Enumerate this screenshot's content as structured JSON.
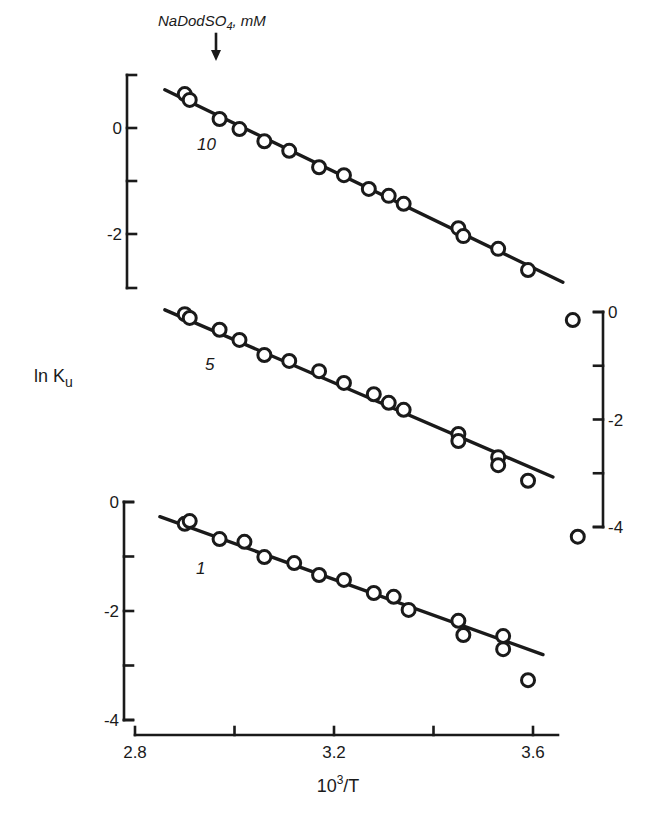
{
  "chart_data": {
    "type": "scatter",
    "title": "",
    "xlabel": "10³/T",
    "ylabel": "ln Ku",
    "annotation": "NaDodSO4, mM",
    "xlim": [
      2.8,
      3.65
    ],
    "xticks": [
      2.8,
      3.0,
      3.2,
      3.4,
      3.6
    ],
    "xtick_labels": [
      "2.8",
      "",
      "3.2",
      "",
      "3.6"
    ],
    "grid": false,
    "legend": "inline labels",
    "series": [
      {
        "name": "10",
        "label": "10",
        "axis": "left-top",
        "ylim": [
          1,
          -3
        ],
        "yticks": [
          0,
          -1,
          -2
        ],
        "ytick_labels": [
          "0",
          "",
          "-2"
        ],
        "x": [
          2.9,
          2.91,
          2.97,
          3.01,
          3.06,
          3.11,
          3.17,
          3.22,
          3.27,
          3.31,
          3.34,
          3.45,
          3.46,
          3.53,
          3.59
        ],
        "y": [
          0.64,
          0.53,
          0.17,
          -0.02,
          -0.25,
          -0.43,
          -0.74,
          -0.89,
          -1.15,
          -1.28,
          -1.43,
          -1.89,
          -2.04,
          -2.28,
          -2.68
        ],
        "fit": {
          "x": [
            2.86,
            3.66
          ],
          "y": [
            0.72,
            -2.91
          ]
        }
      },
      {
        "name": "5",
        "label": "5",
        "axis": "right",
        "ylim": [
          0,
          -4
        ],
        "yticks": [
          0,
          -1,
          -2,
          -3,
          -4
        ],
        "ytick_labels": [
          "0",
          "",
          "-2",
          "",
          "-4"
        ],
        "x": [
          2.9,
          2.91,
          2.97,
          3.01,
          3.06,
          3.11,
          3.17,
          3.22,
          3.28,
          3.31,
          3.34,
          3.45,
          3.45,
          3.53,
          3.53,
          3.59,
          3.68,
          3.69
        ],
        "y": [
          -0.04,
          -0.11,
          -0.33,
          -0.52,
          -0.8,
          -0.91,
          -1.1,
          -1.32,
          -1.53,
          -1.69,
          -1.82,
          -2.27,
          -2.4,
          -2.7,
          -2.85,
          -3.14,
          -0.15,
          -4.18
        ],
        "fit": {
          "x": [
            2.86,
            3.64
          ],
          "y": [
            0.04,
            -3.07
          ]
        }
      },
      {
        "name": "1",
        "label": "1",
        "axis": "left-bottom",
        "ylim": [
          0,
          -4
        ],
        "yticks": [
          0,
          -1,
          -2,
          -3,
          -4
        ],
        "ytick_labels": [
          "0",
          "",
          "-2",
          "",
          "-4"
        ],
        "x": [
          2.9,
          2.91,
          2.97,
          3.02,
          3.06,
          3.12,
          3.17,
          3.22,
          3.28,
          3.32,
          3.35,
          3.45,
          3.46,
          3.54,
          3.54,
          3.59
        ],
        "y": [
          -0.4,
          -0.35,
          -0.68,
          -0.73,
          -1.01,
          -1.12,
          -1.34,
          -1.43,
          -1.67,
          -1.74,
          -1.98,
          -2.18,
          -2.44,
          -2.46,
          -2.7,
          -3.27
        ],
        "fit": {
          "x": [
            2.85,
            3.62
          ],
          "y": [
            -0.27,
            -2.8
          ]
        }
      }
    ]
  }
}
